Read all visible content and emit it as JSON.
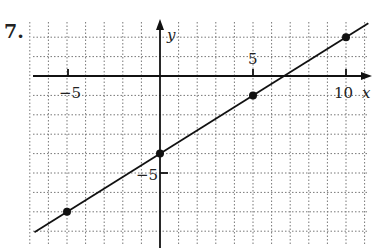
{
  "problem_number": "7.",
  "chart_data": {
    "type": "line",
    "title": "",
    "xlabel": "x",
    "ylabel": "y",
    "xlim": [
      -7,
      11
    ],
    "ylim": [
      -9,
      3
    ],
    "grid": true,
    "tick_labels": {
      "x": [
        "-5",
        "10"
      ],
      "x_ticks": [
        -5,
        5,
        10
      ],
      "y": [
        "5",
        "-5"
      ],
      "y_label_positions": [
        {
          "label": "5",
          "x": 5,
          "y": 0,
          "note": "label above x-axis tick at x=5"
        },
        {
          "label": "-5",
          "x": 0,
          "y": -5
        }
      ]
    },
    "points": [
      {
        "x": -5,
        "y": -7
      },
      {
        "x": 0,
        "y": -4
      },
      {
        "x": 5,
        "y": -1
      },
      {
        "x": 10,
        "y": 2
      }
    ],
    "line": {
      "slope": 0.6,
      "intercept": -4,
      "equation": "y = (3/5)x - 4"
    }
  },
  "labels": {
    "x_axis": "x",
    "y_axis": "y",
    "tick_neg5_x": "−5",
    "tick_5": "5",
    "tick_10": "10",
    "tick_neg5_y": "−5"
  }
}
